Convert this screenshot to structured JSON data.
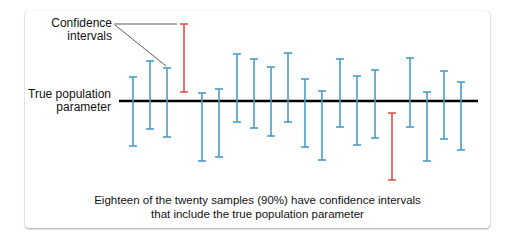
{
  "labels": {
    "confidence_intervals_line1": "Confidence",
    "confidence_intervals_line2": "intervals",
    "true_param_line1": "True population",
    "true_param_line2": "parameter"
  },
  "caption": {
    "line1": "Eighteen of the twenty samples (90%) have confidence intervals",
    "line2": "that include the true population parameter"
  },
  "colors": {
    "included": "#4a9cc7",
    "excluded": "#e0524a",
    "parameter_line": "#000000"
  },
  "parameter_line": {
    "y": 101,
    "x1": 119,
    "x2": 478
  },
  "intervals": [
    {
      "x": 133,
      "top": 77,
      "bottom": 146,
      "includes": true
    },
    {
      "x": 150,
      "top": 61,
      "bottom": 129,
      "includes": true
    },
    {
      "x": 167,
      "top": 68,
      "bottom": 137,
      "includes": true
    },
    {
      "x": 184,
      "top": 24,
      "bottom": 92,
      "includes": false
    },
    {
      "x": 202,
      "top": 93,
      "bottom": 161,
      "includes": true
    },
    {
      "x": 219,
      "top": 89,
      "bottom": 157,
      "includes": true
    },
    {
      "x": 237,
      "top": 54,
      "bottom": 122,
      "includes": true
    },
    {
      "x": 254,
      "top": 59,
      "bottom": 128,
      "includes": true
    },
    {
      "x": 271,
      "top": 67,
      "bottom": 136,
      "includes": true
    },
    {
      "x": 288,
      "top": 53,
      "bottom": 122,
      "includes": true
    },
    {
      "x": 305,
      "top": 79,
      "bottom": 147,
      "includes": true
    },
    {
      "x": 322,
      "top": 91,
      "bottom": 160,
      "includes": true
    },
    {
      "x": 340,
      "top": 59,
      "bottom": 127,
      "includes": true
    },
    {
      "x": 357,
      "top": 76,
      "bottom": 145,
      "includes": true
    },
    {
      "x": 375,
      "top": 70,
      "bottom": 138,
      "includes": true
    },
    {
      "x": 392,
      "top": 113,
      "bottom": 180,
      "includes": false
    },
    {
      "x": 410,
      "top": 58,
      "bottom": 127,
      "includes": true
    },
    {
      "x": 427,
      "top": 92,
      "bottom": 161,
      "includes": true
    },
    {
      "x": 444,
      "top": 71,
      "bottom": 139,
      "includes": true
    },
    {
      "x": 461,
      "top": 82,
      "bottom": 150,
      "includes": true
    }
  ],
  "summary": {
    "total_samples": 20,
    "including_parameter": 18,
    "percent": "90%"
  }
}
